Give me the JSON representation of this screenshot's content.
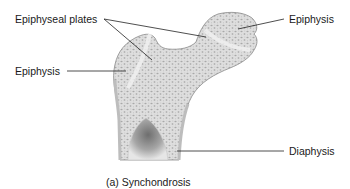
{
  "figure": {
    "caption": "(a) Synchondrosis",
    "labels": {
      "epiphyseal_plates": "Epiphyseal plates",
      "epiphysis_left": "Epiphysis",
      "epiphysis_right": "Epiphysis",
      "diaphysis": "Diaphysis"
    },
    "colors": {
      "bone_fill": "#dcdcdc",
      "bone_outline": "#8a8a8a",
      "plate": "#eeeeee",
      "leader_line": "#222222",
      "cavity": "#9a9a9a"
    }
  }
}
